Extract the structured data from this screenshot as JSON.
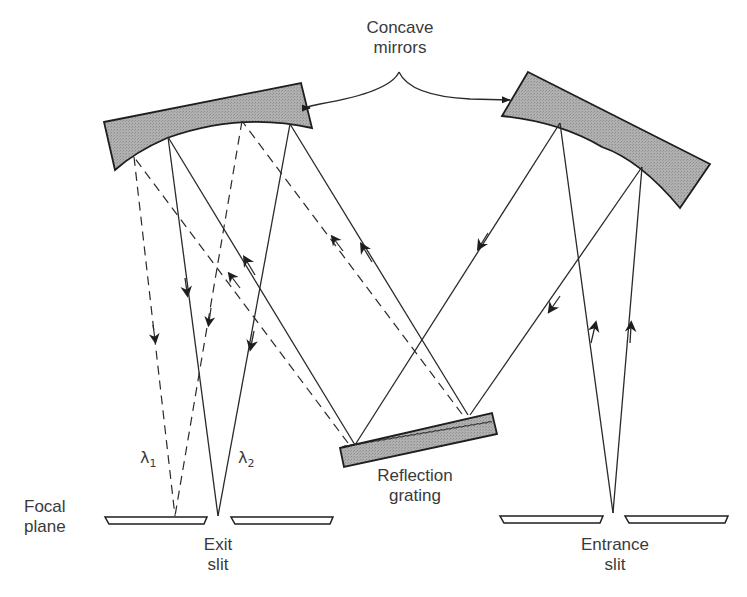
{
  "labels": {
    "concave_mirrors_line1": "Concave",
    "concave_mirrors_line2": "mirrors",
    "focal_plane_line1": "Focal",
    "focal_plane_line2": "plane",
    "exit_slit_line1": "Exit",
    "exit_slit_line2": "slit",
    "entrance_slit_line1": "Entrance",
    "entrance_slit_line2": "slit",
    "grating_line1": "Reflection",
    "grating_line2": "grating",
    "lambda1_symbol": "λ",
    "lambda1_sub": "1",
    "lambda2_symbol": "λ",
    "lambda2_sub": "2"
  },
  "components": [
    {
      "id": "entrance-slit",
      "label": "Entrance slit"
    },
    {
      "id": "collimating-mirror",
      "label": "Concave mirror (right)"
    },
    {
      "id": "reflection-grating",
      "label": "Reflection grating"
    },
    {
      "id": "focusing-mirror",
      "label": "Concave mirror (left)"
    },
    {
      "id": "exit-slit",
      "label": "Exit slit"
    },
    {
      "id": "focal-plane",
      "label": "Focal plane"
    }
  ],
  "rays": {
    "solid": "wavelength λ2 (passes exit slit)",
    "dashed": "wavelength λ1 (focused beside slit)"
  },
  "colors": {
    "line": "#2a2a2a",
    "mirror_fill": "#a8a8a8",
    "text": "#3a3a3a",
    "background": "#ffffff"
  }
}
